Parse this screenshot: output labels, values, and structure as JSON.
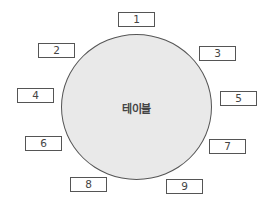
{
  "diagram": {
    "table": {
      "label": "테이블",
      "fill_color": "#e9e9e9",
      "stroke_color": "#555555"
    },
    "seats": [
      {
        "label": "1",
        "x": 118,
        "y": 12
      },
      {
        "label": "2",
        "x": 38,
        "y": 43
      },
      {
        "label": "3",
        "x": 199,
        "y": 46
      },
      {
        "label": "4",
        "x": 17,
        "y": 88
      },
      {
        "label": "5",
        "x": 220,
        "y": 91
      },
      {
        "label": "6",
        "x": 25,
        "y": 136
      },
      {
        "label": "7",
        "x": 209,
        "y": 139
      },
      {
        "label": "8",
        "x": 70,
        "y": 177
      },
      {
        "label": "9",
        "x": 166,
        "y": 179
      }
    ]
  }
}
